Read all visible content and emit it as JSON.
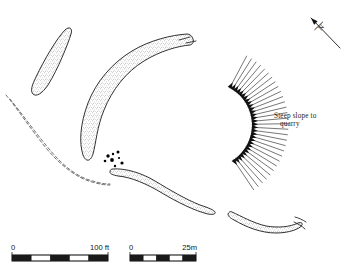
{
  "figure": {
    "kind": "archaeological-site-plan",
    "background_color": "#ffffff",
    "ink_color": "#1a1a1a",
    "stipple_color": "#6e6e6e"
  },
  "annotations": {
    "slope_label_line1": "Steep slope to",
    "slope_label_line2": "quarry",
    "north_letter": "N"
  },
  "scales": {
    "imperial": {
      "zero_label": "0",
      "end_label": "100 ft",
      "segments": 5,
      "x": 12,
      "y": 255,
      "width": 96,
      "height": 6
    },
    "metric": {
      "zero_label": "0",
      "end_label": "25m",
      "segments": 5,
      "x": 130,
      "y": 255,
      "width": 66,
      "height": 6
    }
  },
  "features": {
    "banks": [
      {
        "name": "north-west-oval-bank",
        "path": "M 65 30 C 69 26 73 28 71 34 C 68 44 58 69 48 85 C 42 94 36 97 33 94 C 30 91 32 85 36 77 C 44 60 57 38 65 30 Z"
      },
      {
        "name": "main-curving-rampart",
        "path": "M 187 34 C 172 35 150 40 132 51 C 112 63 96 82 88 103 C 80 124 79 143 83 155 C 86 163 91 161 93 154 C 96 143 97 127 104 110 C 112 90 126 72 144 61 C 160 51 178 46 190 45 C 193 44 194 42 193 39 C 192 36 190 34 187 34 Z"
      },
      {
        "name": "central-sinuous-bank",
        "path": "M 113 169 C 125 168 142 173 155 181 C 170 190 185 199 200 205 C 209 208 214 210 215 212 C 216 214 213 215 208 214 C 195 211 177 202 162 193 C 147 184 131 177 118 176 C 113 175 110 174 110 172 C 110 170 111 169 113 169 Z"
      },
      {
        "name": "south-east-bank",
        "path": "M 232 212 C 241 216 253 223 266 226 C 278 228 290 227 298 223 C 301 222 303 223 302 225 C 300 229 289 233 276 233 C 261 233 246 227 234 220 C 230 218 228 216 228 214 C 229 212 230 211 232 212 Z"
      }
    ],
    "dashed_boundaries": [
      {
        "name": "outer-boundary-dash",
        "path": "M 6 95 C 16 107 30 128 46 148 C 61 166 77 178 92 182 C 99 184 104 185 110 185"
      },
      {
        "name": "inner-boundary-dash",
        "path": "M 10 99 C 20 111 34 131 50 150 C 64 167 79 178 93 181 C 99 183 104 184 110 184"
      }
    ],
    "dash_fragments": [
      {
        "name": "rampart-continuation-upper",
        "path": "M 179 40 L 190 37"
      },
      {
        "name": "rampart-continuation-tip",
        "path": "M 186 43 L 196 41"
      },
      {
        "name": "south-bank-continuation",
        "path": "M 295 217 C 299 218 303 220 306 222"
      },
      {
        "name": "south-bank-continuation-2",
        "path": "M 294 222 C 298 224 302 226 305 229"
      }
    ],
    "dots": [
      {
        "name": "feature-dot",
        "cx": 108,
        "cy": 156,
        "r": 1.7
      },
      {
        "name": "feature-dot",
        "cx": 113,
        "cy": 154,
        "r": 1.2
      },
      {
        "name": "feature-dot",
        "cx": 118,
        "cy": 152,
        "r": 1.5
      },
      {
        "name": "feature-dot",
        "cx": 112,
        "cy": 160,
        "r": 1.9
      },
      {
        "name": "feature-dot",
        "cx": 119,
        "cy": 158,
        "r": 1.1
      },
      {
        "name": "feature-dot",
        "cx": 122,
        "cy": 163,
        "r": 1.6
      },
      {
        "name": "feature-dot",
        "cx": 105,
        "cy": 161,
        "r": 1.3
      },
      {
        "name": "feature-dot",
        "cx": 115,
        "cy": 166,
        "r": 1.2
      }
    ],
    "hachures": {
      "name": "steep-slope-hachures",
      "count": 30,
      "arc": {
        "cx": 210,
        "cy": 125,
        "radius_inner": 42,
        "tail_length": 36,
        "angle_start": -62,
        "angle_end": 56
      }
    },
    "north_arrow": {
      "name": "north-arrow",
      "tail_x": 340,
      "tail_y": 48,
      "tip_x": 311,
      "tip_y": 18,
      "bar_half": 5.5,
      "letter_x": 321,
      "letter_y": 31
    }
  }
}
